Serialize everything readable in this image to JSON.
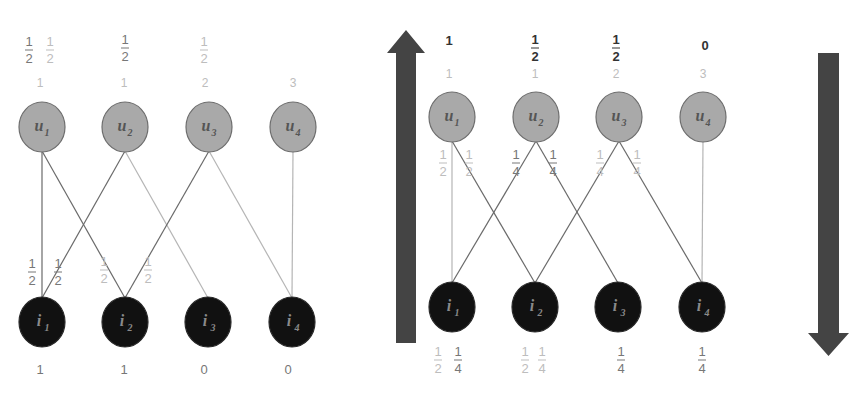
{
  "colors": {
    "user_node_fill": "#a9a9a9",
    "user_node_stroke": "#6e6e6e",
    "item_node_fill": "#111111",
    "item_node_stroke": "#2a2a2a",
    "edge_dark": "#6a6a6a",
    "edge_light": "#b5b5b5",
    "arrow_fill": "#444444",
    "text_dark": "#333333",
    "text_mid": "#777777",
    "text_light": "#bdbdbd",
    "user_label": "#555555",
    "item_label": "#8a8a8a"
  },
  "graphs": [
    {
      "id": "left",
      "users": [
        {
          "label": "u",
          "sub": "1",
          "x": 42,
          "y": 127
        },
        {
          "label": "u",
          "sub": "2",
          "x": 125,
          "y": 127
        },
        {
          "label": "u",
          "sub": "3",
          "x": 209,
          "y": 127
        },
        {
          "label": "u",
          "sub": "4",
          "x": 293,
          "y": 127
        }
      ],
      "items": [
        {
          "label": "i",
          "sub": "1",
          "x": 42,
          "y": 322
        },
        {
          "label": "i",
          "sub": "2",
          "x": 125,
          "y": 322
        },
        {
          "label": "i",
          "sub": "3",
          "x": 208,
          "y": 322
        },
        {
          "label": "i",
          "sub": "4",
          "x": 292,
          "y": 322
        }
      ],
      "edges": [
        {
          "u": 0,
          "i": 0,
          "tone": "dark"
        },
        {
          "u": 0,
          "i": 1,
          "tone": "dark"
        },
        {
          "u": 1,
          "i": 0,
          "tone": "dark"
        },
        {
          "u": 1,
          "i": 2,
          "tone": "light"
        },
        {
          "u": 2,
          "i": 1,
          "tone": "dark"
        },
        {
          "u": 2,
          "i": 3,
          "tone": "light"
        },
        {
          "u": 3,
          "i": 3,
          "tone": "light"
        }
      ],
      "top_fractions": [
        {
          "num": "1",
          "den": "2",
          "x": 29,
          "y": 50,
          "tone": "mid"
        },
        {
          "num": "1",
          "den": "2",
          "x": 50,
          "y": 50,
          "tone": "light"
        },
        {
          "num": "1",
          "den": "2",
          "x": 125,
          "y": 48,
          "tone": "mid"
        },
        {
          "num": "1",
          "den": "2",
          "x": 204,
          "y": 50,
          "tone": "light"
        }
      ],
      "degree_row": [
        {
          "text": "1",
          "x": 40,
          "y": 87
        },
        {
          "text": "1",
          "x": 124,
          "y": 87
        },
        {
          "text": "2",
          "x": 205,
          "y": 87
        },
        {
          "text": "3",
          "x": 293,
          "y": 87
        }
      ],
      "edge_labels": [
        {
          "num": "1",
          "den": "2",
          "x": 32,
          "y": 272,
          "tone": "mid"
        },
        {
          "num": "1",
          "den": "2",
          "x": 58,
          "y": 272,
          "tone": "mid"
        },
        {
          "num": "1",
          "den": "2",
          "x": 104,
          "y": 270,
          "tone": "light"
        },
        {
          "num": "1",
          "den": "2",
          "x": 148,
          "y": 270,
          "tone": "light"
        }
      ],
      "bottom_values": [
        {
          "text": "1",
          "x": 40,
          "y": 374
        },
        {
          "text": "1",
          "x": 124,
          "y": 374
        },
        {
          "text": "0",
          "x": 204,
          "y": 374
        },
        {
          "text": "0",
          "x": 288,
          "y": 374
        }
      ]
    },
    {
      "id": "right",
      "users": [
        {
          "label": "u",
          "sub": "1",
          "x": 452,
          "y": 117
        },
        {
          "label": "u",
          "sub": "2",
          "x": 536,
          "y": 117
        },
        {
          "label": "u",
          "sub": "3",
          "x": 619,
          "y": 117
        },
        {
          "label": "u",
          "sub": "4",
          "x": 703,
          "y": 117
        }
      ],
      "items": [
        {
          "label": "i",
          "sub": "1",
          "x": 452,
          "y": 307
        },
        {
          "label": "i",
          "sub": "2",
          "x": 535,
          "y": 307
        },
        {
          "label": "i",
          "sub": "3",
          "x": 618,
          "y": 307
        },
        {
          "label": "i",
          "sub": "4",
          "x": 702,
          "y": 307
        }
      ],
      "edges": [
        {
          "u": 0,
          "i": 0,
          "tone": "light"
        },
        {
          "u": 0,
          "i": 1,
          "tone": "dark"
        },
        {
          "u": 1,
          "i": 0,
          "tone": "dark"
        },
        {
          "u": 1,
          "i": 2,
          "tone": "dark"
        },
        {
          "u": 2,
          "i": 1,
          "tone": "dark"
        },
        {
          "u": 2,
          "i": 3,
          "tone": "dark"
        },
        {
          "u": 3,
          "i": 3,
          "tone": "light"
        }
      ],
      "top_fractions": [
        {
          "num": "1",
          "den": "2",
          "x": 535,
          "y": 48,
          "tone": "dark"
        },
        {
          "num": "1",
          "den": "2",
          "x": 616,
          "y": 48,
          "tone": "dark"
        }
      ],
      "top_values": [
        {
          "text": "1",
          "x": 449,
          "y": 45
        },
        {
          "text": "0",
          "x": 705,
          "y": 50
        }
      ],
      "degree_row": [
        {
          "text": "1",
          "x": 449,
          "y": 78
        },
        {
          "text": "1",
          "x": 535,
          "y": 78
        },
        {
          "text": "2",
          "x": 616,
          "y": 78
        },
        {
          "text": "3",
          "x": 703,
          "y": 78
        }
      ],
      "edge_labels": [
        {
          "num": "1",
          "den": "2",
          "x": 443,
          "y": 163,
          "tone": "light"
        },
        {
          "num": "1",
          "den": "2",
          "x": 469,
          "y": 163,
          "tone": "light"
        },
        {
          "num": "1",
          "den": "4",
          "x": 516,
          "y": 163,
          "tone": "mid"
        },
        {
          "num": "1",
          "den": "4",
          "x": 553,
          "y": 163,
          "tone": "mid"
        },
        {
          "num": "1",
          "den": "4",
          "x": 600,
          "y": 163,
          "tone": "light"
        },
        {
          "num": "1",
          "den": "4",
          "x": 637,
          "y": 163,
          "tone": "light"
        }
      ],
      "bottom_fractions": [
        {
          "num": "1",
          "den": "2",
          "x": 438,
          "y": 360,
          "tone": "light"
        },
        {
          "num": "1",
          "den": "4",
          "x": 458,
          "y": 360,
          "tone": "mid"
        },
        {
          "num": "1",
          "den": "2",
          "x": 525,
          "y": 360,
          "tone": "light"
        },
        {
          "num": "1",
          "den": "4",
          "x": 542,
          "y": 360,
          "tone": "light"
        },
        {
          "num": "1",
          "den": "4",
          "x": 621,
          "y": 360,
          "tone": "mid"
        },
        {
          "num": "1",
          "den": "4",
          "x": 702,
          "y": 360,
          "tone": "mid"
        }
      ]
    }
  ],
  "arrows": [
    {
      "name": "up-arrow",
      "direction": "up",
      "shaft_x1": 396,
      "shaft_x2": 416,
      "shaft_y1": 53,
      "shaft_y2": 343,
      "head_x1": 387,
      "head_x2": 425,
      "tip_y": 30
    },
    {
      "name": "down-arrow",
      "direction": "down",
      "shaft_x1": 818,
      "shaft_x2": 839,
      "shaft_y1": 53,
      "shaft_y2": 333,
      "head_x1": 808,
      "head_x2": 849,
      "tip_y": 356
    }
  ]
}
